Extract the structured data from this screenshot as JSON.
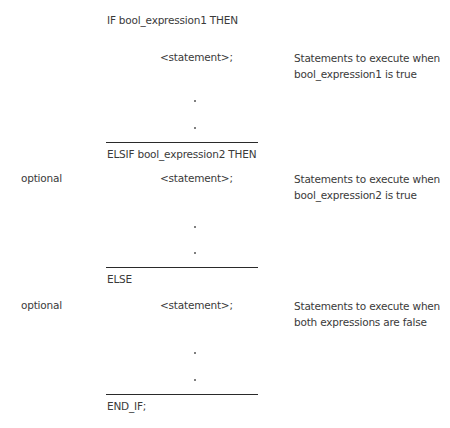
{
  "blocks": [
    {
      "header": "IF bool_expression1 THEN",
      "side_label": "",
      "statement": "<statement>;",
      "description": [
        "Statements to execute when",
        "bool_expression1 is true"
      ],
      "continuation": [
        ".",
        "."
      ]
    },
    {
      "header": "ELSIF bool_expression2 THEN",
      "side_label": "optional",
      "statement": "<statement>;",
      "description": [
        "Statements to execute when",
        "bool_expression2 is true"
      ],
      "continuation": [
        ".",
        "."
      ]
    },
    {
      "header": "ELSE",
      "side_label": "optional",
      "statement": "<statement>;",
      "description": [
        "Statements to execute when",
        "both expressions are false"
      ],
      "continuation": [
        ".",
        "."
      ]
    }
  ],
  "footer": "END_IF;"
}
